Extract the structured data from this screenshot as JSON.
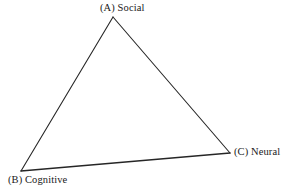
{
  "figure": {
    "type": "triangle-diagram",
    "background_color": "#ffffff",
    "stroke_color": "#262626",
    "text_color": "#1a1a1a",
    "width": 291,
    "height": 192,
    "vertices": [
      {
        "id": "A",
        "label": "(A) Social",
        "x": 113,
        "y": 17,
        "label_position": "above"
      },
      {
        "id": "B",
        "label": "(B) Cognitive",
        "x": 21,
        "y": 171,
        "label_position": "below-left"
      },
      {
        "id": "C",
        "label": "(C) Neural",
        "x": 230,
        "y": 153,
        "label_position": "right"
      }
    ],
    "edges": [
      {
        "from": "A",
        "to": "B",
        "stroke_width": 1.1
      },
      {
        "from": "A",
        "to": "C",
        "stroke_width": 1.1
      },
      {
        "from": "B",
        "to": "C",
        "stroke_width": 1.5
      }
    ]
  }
}
